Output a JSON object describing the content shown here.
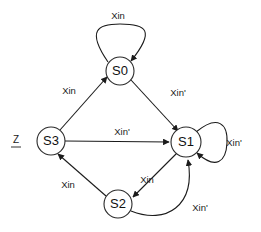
{
  "diagram": {
    "type": "finite-state-machine",
    "background_color": "#ffffff",
    "line_color": "#1b1b1b",
    "node_fill": "#ffffff",
    "states": [
      {
        "id": "S0",
        "label": "S0",
        "cx": 120,
        "cy": 71,
        "r": 14
      },
      {
        "id": "S1",
        "label": "S1",
        "cx": 186,
        "cy": 142,
        "r": 15
      },
      {
        "id": "S2",
        "label": "S2",
        "cx": 118,
        "cy": 204,
        "r": 14
      },
      {
        "id": "S3",
        "label": "S3",
        "cx": 51,
        "cy": 141,
        "r": 14
      }
    ],
    "outputs": [
      {
        "id": "z-on-s3",
        "label": "Z",
        "underlined": true,
        "x": 16,
        "y": 140
      }
    ],
    "transitions": [
      {
        "id": "s0-self",
        "from": "S0",
        "to": "S0",
        "label": "Xin",
        "label_x": 118,
        "label_y": 16
      },
      {
        "id": "s3-to-s0",
        "from": "S3",
        "to": "S0",
        "label": "Xin",
        "label_x": 69,
        "label_y": 91
      },
      {
        "id": "s0-to-s1",
        "from": "S0",
        "to": "S1",
        "label": "Xin'",
        "label_x": 178,
        "label_y": 93
      },
      {
        "id": "s3-to-s1",
        "from": "S3",
        "to": "S1",
        "label": "Xin'",
        "label_x": 122,
        "label_y": 132
      },
      {
        "id": "s1-self",
        "from": "S1",
        "to": "S1",
        "label": "Xin'",
        "label_x": 234,
        "label_y": 143
      },
      {
        "id": "s1-to-s2",
        "from": "S1",
        "to": "S2",
        "label": "Xin",
        "label_x": 147,
        "label_y": 180
      },
      {
        "id": "s2-to-s1",
        "from": "S2",
        "to": "S1",
        "label": "Xin'",
        "label_x": 200,
        "label_y": 208
      },
      {
        "id": "s2-to-s3",
        "from": "S2",
        "to": "S3",
        "label": "Xin",
        "label_x": 68,
        "label_y": 185
      }
    ]
  }
}
